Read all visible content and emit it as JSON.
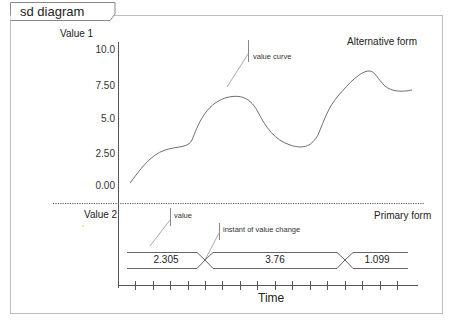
{
  "frame": {
    "tab_label": "sd diagram"
  },
  "upper_section": {
    "axis_title": "Value 1",
    "form_label": "Alternative form",
    "y_ticks": [
      "10.0",
      "7.50",
      "5.0",
      "2.50",
      "0.00"
    ],
    "annotation": "value curve"
  },
  "lower_section": {
    "axis_title": "Value 2",
    "form_label": "Primary form",
    "annotations": {
      "value": "value",
      "change": "instant of value change"
    },
    "values": [
      "2.305",
      "3.76",
      "1.099"
    ]
  },
  "x_axis": {
    "label": "Time",
    "tick_count": 16
  },
  "colors": {
    "line": "#6f6f6f",
    "frame": "#b8b8b8",
    "axis": "#555555"
  }
}
